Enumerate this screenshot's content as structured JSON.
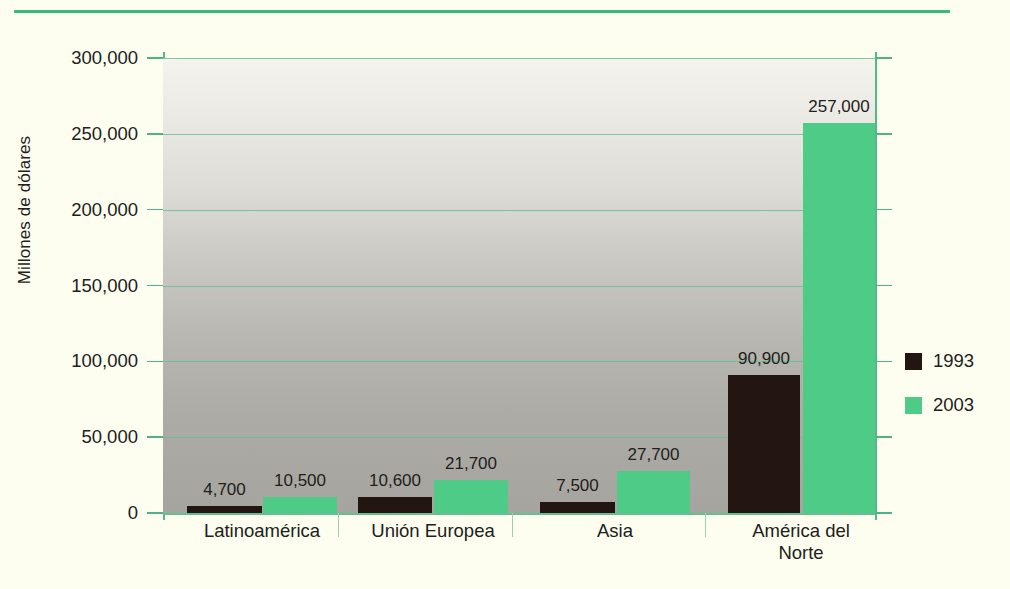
{
  "chart_data": {
    "type": "bar",
    "title": "",
    "subtitle": "",
    "xlabel": "",
    "ylabel": "Millones de dólares",
    "categories": [
      "Latinoamérica",
      "Unión Europea",
      "Asia",
      "América del\nNorte"
    ],
    "series": [
      {
        "name": "1993",
        "color": "#231512",
        "values": [
          4700,
          10600,
          7500,
          90900
        ],
        "value_labels": [
          "4,700",
          "10,600",
          "7,500",
          "90,900"
        ]
      },
      {
        "name": "2003",
        "color": "#4ecb87",
        "values": [
          10500,
          21700,
          27700,
          257000
        ],
        "value_labels": [
          "10,500",
          "21,700",
          "27,700",
          "257,000"
        ]
      }
    ],
    "ylim": [
      0,
      300000
    ],
    "yticks": [
      0,
      50000,
      100000,
      150000,
      200000,
      250000,
      300000
    ],
    "ytick_labels": [
      "0",
      "50,000",
      "100,000",
      "150,000",
      "200,000",
      "250,000",
      "300,000"
    ],
    "grid": true,
    "legend_position": "right",
    "accent_color": "#3cb878",
    "grid_color": "#66bf94",
    "page_background": "#fdfdf0",
    "plot_background": "gray-vertical-gradient"
  }
}
